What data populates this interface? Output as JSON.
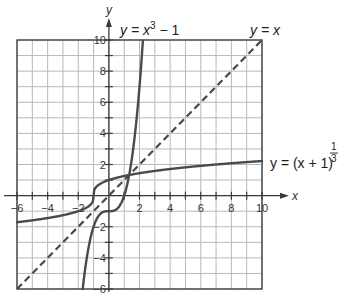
{
  "chart_data": {
    "type": "line",
    "title": "",
    "xlabel": "x",
    "ylabel": "y",
    "xlim": [
      -6,
      10
    ],
    "ylim": [
      -6,
      10
    ],
    "grid": true,
    "grid_step": 1,
    "x_ticks": [
      -6,
      -4,
      -2,
      2,
      4,
      6,
      8,
      10
    ],
    "x_tick_labels": [
      "−6",
      "−4",
      "−2",
      "2",
      "4",
      "6",
      "8",
      "10"
    ],
    "y_ticks": [
      -6,
      -4,
      -2,
      2,
      4,
      6,
      8,
      10
    ],
    "y_tick_labels": [
      "−6",
      "−4",
      "−2",
      "2",
      "4",
      "6",
      "8",
      "10"
    ],
    "series": [
      {
        "name": "y = x^3 − 1",
        "function": "cube_minus_one",
        "style": "solid",
        "x_range": [
          -1.71,
          2.22
        ]
      },
      {
        "name": "y = x",
        "function": "identity",
        "style": "dashed",
        "x_range": [
          -6,
          10
        ]
      },
      {
        "name": "y = (x + 1)^(1/3)",
        "function": "cube_root_plus_one",
        "style": "solid",
        "x_range": [
          -6,
          10
        ]
      }
    ],
    "annotations": {
      "cube_label": {
        "prefix": "y = x",
        "exponent": "3",
        "suffix": " − 1"
      },
      "identity_label": "y = x",
      "root_label": {
        "prefix": "y = (x + 1)",
        "exp_num": "1",
        "exp_den": "3"
      }
    }
  }
}
